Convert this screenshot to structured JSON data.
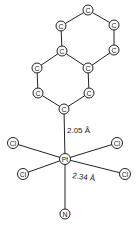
{
  "diagram": {
    "type": "molecular-structure",
    "atoms": [
      {
        "id": "c1",
        "symbol": "C",
        "x": 88,
        "y": 10
      },
      {
        "id": "c2",
        "symbol": "C",
        "x": 61,
        "y": 26
      },
      {
        "id": "c3",
        "symbol": "C",
        "x": 114,
        "y": 25
      },
      {
        "id": "c4",
        "symbol": "C",
        "x": 114,
        "y": 50
      },
      {
        "id": "c5",
        "symbol": "C",
        "x": 62,
        "y": 51
      },
      {
        "id": "c6",
        "symbol": "C",
        "x": 88,
        "y": 68
      },
      {
        "id": "c7",
        "symbol": "C",
        "x": 37,
        "y": 68
      },
      {
        "id": "c8",
        "symbol": "C",
        "x": 38,
        "y": 93
      },
      {
        "id": "c9",
        "symbol": "C",
        "x": 89,
        "y": 93
      },
      {
        "id": "c10",
        "symbol": "C",
        "x": 64,
        "y": 109
      },
      {
        "id": "pt",
        "symbol": "Pt",
        "x": 65,
        "y": 159
      },
      {
        "id": "cl1",
        "symbol": "Cl",
        "x": 13,
        "y": 143
      },
      {
        "id": "cl2",
        "symbol": "Cl",
        "x": 117,
        "y": 143
      },
      {
        "id": "cl3",
        "symbol": "Cl",
        "x": 23,
        "y": 174
      },
      {
        "id": "cl4",
        "symbol": "Cl",
        "x": 125,
        "y": 174
      },
      {
        "id": "n",
        "symbol": "N",
        "x": 65,
        "y": 214
      }
    ],
    "bonds": [
      [
        "c1",
        "c2"
      ],
      [
        "c1",
        "c3"
      ],
      [
        "c3",
        "c4"
      ],
      [
        "c4",
        "c6"
      ],
      [
        "c2",
        "c5"
      ],
      [
        "c5",
        "c6"
      ],
      [
        "c5",
        "c7"
      ],
      [
        "c7",
        "c8"
      ],
      [
        "c8",
        "c10"
      ],
      [
        "c6",
        "c9"
      ],
      [
        "c9",
        "c10"
      ],
      [
        "c10",
        "pt"
      ],
      [
        "pt",
        "cl1"
      ],
      [
        "pt",
        "cl2"
      ],
      [
        "pt",
        "cl3"
      ],
      [
        "pt",
        "cl4"
      ],
      [
        "pt",
        "n"
      ]
    ],
    "labels": [
      {
        "id": "bond-length-pt-c",
        "text": "2.05 Å",
        "x": 67,
        "y": 133,
        "rotate": 0
      },
      {
        "id": "bond-length-pt-cl",
        "text": "2.34 Å",
        "x": 72,
        "y": 178,
        "rotate": 8
      }
    ]
  }
}
